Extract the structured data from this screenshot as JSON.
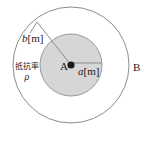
{
  "figure": {
    "type": "concentric-circles-cross-section",
    "background_color": "#ffffff",
    "stroke_color": "#8c8c8c",
    "inner_fill_color": "#d4d4d4",
    "center_dot_color": "#1a1a1a",
    "labels": {
      "inner_radius": {
        "symbol": "a",
        "unit": "[m]",
        "text": "a[m]"
      },
      "outer_radius": {
        "symbol": "b",
        "unit": "[m]",
        "text": "b[m]"
      },
      "inner_point": "A",
      "outer_point": "B",
      "resistivity_caption": "抵抗率",
      "resistivity_symbol": "ρ"
    },
    "geometry": {
      "center_x": 71,
      "center_y": 65,
      "inner_radius_px": 31,
      "outer_radius_px": 58,
      "radius_line_a": {
        "x1": 71,
        "y1": 63,
        "x2": 102,
        "y2": 63
      },
      "radius_line_b": {
        "x1": 71,
        "y1": 65,
        "x2": 37,
        "y2": 22
      },
      "leader_line_b": {
        "x1": 37,
        "y1": 22,
        "x2": 30,
        "y2": 32
      }
    }
  }
}
